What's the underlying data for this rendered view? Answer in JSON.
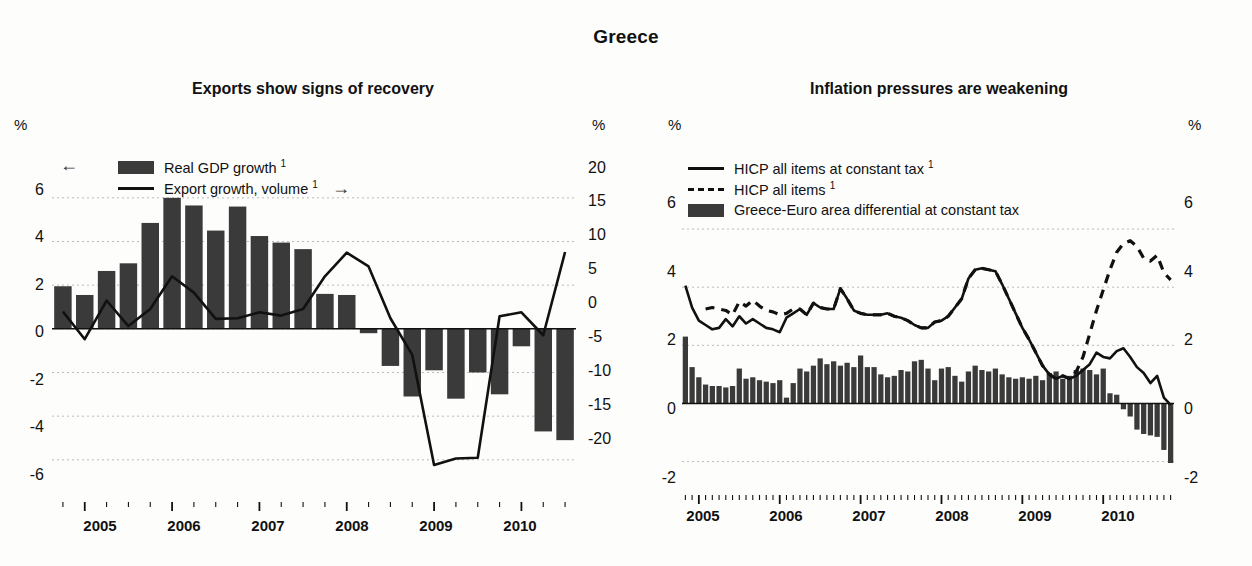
{
  "header": {
    "title": "Greece"
  },
  "panels": {
    "left": {
      "title": "Exports show signs of recovery",
      "pct_left": "%",
      "pct_right": "%",
      "legend": {
        "bar_label": "Real GDP growth ",
        "bar_sup": "1",
        "line_label": "Export growth, volume ",
        "line_sup": "1",
        "left_arrow": "←",
        "right_arrow": "→"
      },
      "yleft_ticks": [
        "6",
        "4",
        "2",
        "0",
        "-2",
        "-4",
        "-6"
      ],
      "yright_ticks": [
        "20",
        "15",
        "10",
        "5",
        "0",
        "-5",
        "-10",
        "-15",
        "-20"
      ],
      "xlabels": [
        "2005",
        "2006",
        "2007",
        "2008",
        "2009",
        "2010"
      ]
    },
    "right": {
      "title": "Inflation pressures are weakening",
      "pct_left": "%",
      "pct_right": "%",
      "legend": {
        "solid_label": "HICP all items at constant tax ",
        "solid_sup": "1",
        "dash_label": "HICP all items ",
        "dash_sup": "1",
        "bar_label": "Greece-Euro area differential at constant tax"
      },
      "yleft_ticks": [
        "6",
        "4",
        "2",
        "0",
        "-2"
      ],
      "yright_ticks": [
        "6",
        "4",
        "2",
        "0",
        "-2"
      ],
      "xlabels": [
        "2005",
        "2006",
        "2007",
        "2008",
        "2009",
        "2010"
      ]
    }
  },
  "colors": {
    "bar_fill": "#3a3a3a",
    "line": "#111111",
    "grid": "#bbbbbb",
    "axis": "#111111",
    "background": "#fdfdfb"
  },
  "chart_data": [
    {
      "type": "bar",
      "id": "exports-show-signs-of-recovery",
      "title": "Exports show signs of recovery",
      "panel_header": "Greece",
      "xlabel": "",
      "ylabel": "%",
      "y2label": "%",
      "ylim": [
        -7.2,
        7.0
      ],
      "y2lim": [
        -24,
        23.3
      ],
      "yticks": [
        -6,
        -4,
        -2,
        0,
        2,
        4,
        6
      ],
      "y2ticks": [
        -20,
        -15,
        -10,
        -5,
        0,
        5,
        10,
        15,
        20
      ],
      "grid": true,
      "legend_position": "top-left",
      "x_tick_labels": [
        "2005",
        "2006",
        "2007",
        "2008",
        "2009",
        "2010"
      ],
      "x_frequency": "quarterly",
      "x": [
        "2004Q4",
        "2005Q1",
        "2005Q2",
        "2005Q3",
        "2005Q4",
        "2006Q1",
        "2006Q2",
        "2006Q3",
        "2006Q4",
        "2007Q1",
        "2007Q2",
        "2007Q3",
        "2007Q4",
        "2008Q1",
        "2008Q2",
        "2008Q3",
        "2008Q4",
        "2009Q1",
        "2009Q2",
        "2009Q3",
        "2009Q4",
        "2010Q1",
        "2010Q2",
        "2010Q3"
      ],
      "series": [
        {
          "name": "Real GDP growth",
          "footnote": "1",
          "kind": "bar",
          "axis": "left",
          "unit": "%",
          "values": [
            1.95,
            1.55,
            2.65,
            3.0,
            4.85,
            6.0,
            5.65,
            4.5,
            5.6,
            4.25,
            3.95,
            3.65,
            1.6,
            1.55,
            -0.2,
            -1.7,
            -3.1,
            -1.9,
            -3.2,
            -2.0,
            -3.0,
            -0.8,
            -4.7,
            -5.1
          ]
        },
        {
          "name": "Export growth, volume",
          "footnote": "1",
          "kind": "line",
          "axis": "right",
          "unit": "%",
          "values": [
            2.6,
            -1.6,
            4.3,
            0.4,
            3.0,
            8.0,
            5.5,
            1.5,
            1.6,
            2.5,
            2.0,
            3.0,
            8.0,
            11.6,
            9.5,
            1.6,
            -4.0,
            -20.8,
            -19.8,
            -19.7,
            1.9,
            2.5,
            -1.0,
            11.7
          ]
        }
      ]
    },
    {
      "type": "bar",
      "id": "inflation-pressures-are-weakening",
      "title": "Inflation pressures are weakening",
      "panel_header": "Greece",
      "xlabel": "",
      "ylabel": "%",
      "y2label": "%",
      "ylim": [
        -2.6,
        7.0
      ],
      "y2lim": [
        -2.6,
        7.0
      ],
      "yticks": [
        -2,
        0,
        2,
        4,
        6
      ],
      "y2ticks": [
        -2,
        0,
        2,
        4,
        6
      ],
      "grid": true,
      "legend_position": "top-left",
      "x_tick_labels": [
        "2005",
        "2006",
        "2007",
        "2008",
        "2009",
        "2010"
      ],
      "x_frequency": "monthly",
      "x_start": "2004-11",
      "x_end": "2010-10",
      "series": [
        {
          "name": "HICP all items at constant tax",
          "footnote": "1",
          "kind": "line",
          "style": "solid",
          "axis": "left",
          "unit": "%",
          "values": [
            4.05,
            3.3,
            2.85,
            2.7,
            2.55,
            2.6,
            2.9,
            2.65,
            3.0,
            2.75,
            2.9,
            2.75,
            2.6,
            2.55,
            2.45,
            2.95,
            3.1,
            3.25,
            3.05,
            3.45,
            3.3,
            3.25,
            3.25,
            3.95,
            3.6,
            3.2,
            3.1,
            3.05,
            3.05,
            3.05,
            3.1,
            3.0,
            2.95,
            2.85,
            2.7,
            2.6,
            2.6,
            2.8,
            2.85,
            3.0,
            3.3,
            3.6,
            4.3,
            4.6,
            4.65,
            4.6,
            4.55,
            4.1,
            3.6,
            3.1,
            2.6,
            2.2,
            1.75,
            1.3,
            1.0,
            0.85,
            0.95,
            0.85,
            0.95,
            1.15,
            1.35,
            1.75,
            1.6,
            1.55,
            1.8,
            1.9,
            1.6,
            1.25,
            1.05,
            0.7,
            0.95,
            0.2,
            -0.05
          ]
        },
        {
          "name": "HICP all items",
          "footnote": "1",
          "kind": "line",
          "style": "dashed",
          "axis": "left",
          "unit": "%",
          "values": [
            null,
            null,
            null,
            3.25,
            3.3,
            3.25,
            3.2,
            3.05,
            3.5,
            3.35,
            3.55,
            3.35,
            3.2,
            3.15,
            3.05,
            3.1,
            3.25,
            3.25,
            3.05,
            3.45,
            3.3,
            3.25,
            3.25,
            3.95,
            3.6,
            3.2,
            3.1,
            3.05,
            3.05,
            3.05,
            3.1,
            3.0,
            2.95,
            2.85,
            2.7,
            2.6,
            2.6,
            2.8,
            2.85,
            3.0,
            3.3,
            3.6,
            4.3,
            4.6,
            4.65,
            4.6,
            4.55,
            4.1,
            3.6,
            3.1,
            2.6,
            2.2,
            1.75,
            1.3,
            1.0,
            0.85,
            0.95,
            0.85,
            1.1,
            1.6,
            2.4,
            3.2,
            3.9,
            4.6,
            5.2,
            5.5,
            5.6,
            5.4,
            5.0,
            4.9,
            5.1,
            4.5,
            4.25
          ]
        },
        {
          "name": "Greece-Euro area differential at constant tax",
          "kind": "bar",
          "axis": "left",
          "unit": "%",
          "values": [
            2.3,
            1.25,
            0.9,
            0.65,
            0.6,
            0.6,
            0.55,
            0.6,
            1.2,
            0.85,
            0.9,
            0.8,
            0.75,
            0.7,
            0.8,
            0.2,
            0.7,
            1.2,
            1.1,
            1.3,
            1.55,
            1.35,
            1.45,
            1.3,
            1.4,
            1.25,
            1.65,
            1.25,
            1.25,
            1.0,
            0.9,
            0.95,
            1.15,
            1.1,
            1.45,
            1.5,
            1.2,
            0.8,
            1.2,
            1.25,
            0.95,
            0.75,
            1.1,
            1.3,
            1.15,
            1.1,
            1.2,
            1.0,
            0.9,
            0.85,
            0.9,
            0.85,
            0.95,
            0.8,
            1.05,
            1.1,
            0.85,
            0.95,
            1.15,
            1.2,
            1.15,
            1.0,
            1.2,
            0.35,
            0.3,
            -0.2,
            -0.45,
            -0.9,
            -1.05,
            -1.1,
            -1.15,
            -1.6,
            -2.05
          ]
        }
      ]
    }
  ]
}
